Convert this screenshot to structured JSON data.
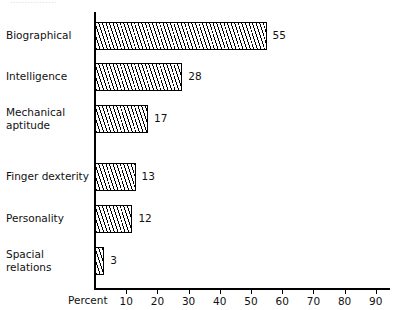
{
  "top_remnant": "................",
  "chart_data": {
    "type": "bar",
    "orientation": "horizontal",
    "title": "",
    "xlabel": "Percent",
    "ylabel": "",
    "xlim": [
      0,
      95
    ],
    "grid": false,
    "legend": "none",
    "categories": [
      "Biographical",
      "Intelligence",
      "Mechanical aptitude",
      "Finger dexterity",
      "Personality",
      "Spacial relations"
    ],
    "values": [
      55,
      28,
      17,
      13,
      12,
      3
    ],
    "value_labels": [
      "55",
      "28",
      "17",
      "13",
      "12",
      "3"
    ],
    "tick_values": [
      10,
      20,
      30,
      40,
      50,
      60,
      70,
      80,
      90
    ],
    "tick_labels": [
      "10",
      "20",
      "30",
      "40",
      "50",
      "60",
      "70",
      "80",
      "90"
    ]
  },
  "style": {
    "bar_fill": "#ffffff",
    "bar_edge": "#000000",
    "hatch": "diagonal-lines",
    "background": "#ffffff",
    "text_color": "#111111"
  }
}
